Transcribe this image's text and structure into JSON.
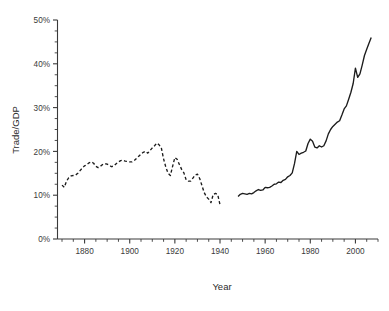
{
  "chart_data": {
    "type": "line",
    "title": "",
    "xlabel": "Year",
    "ylabel": "Trade/GDP",
    "xlim": [
      1868,
      2010
    ],
    "ylim": [
      0,
      50
    ],
    "grid": false,
    "legend": null,
    "y_unit": "%",
    "x_tick_labels": [
      "1880",
      "1900",
      "1920",
      "1940",
      "1960",
      "1980",
      "2000"
    ],
    "x_ticks": [
      1880,
      1900,
      1920,
      1940,
      1960,
      1980,
      2000
    ],
    "x_minor_step": 5,
    "y_tick_labels": [
      "0%",
      "10%",
      "20%",
      "30%",
      "40%",
      "50%"
    ],
    "y_ticks": [
      0,
      10,
      20,
      30,
      40,
      50
    ],
    "y_minor_step": 2.5,
    "series": [
      {
        "name": "Trade/GDP (pre-war)",
        "style": "dashed",
        "x": [
          1870,
          1871,
          1872,
          1873,
          1874,
          1875,
          1876,
          1877,
          1878,
          1879,
          1880,
          1881,
          1882,
          1883,
          1884,
          1885,
          1886,
          1887,
          1888,
          1889,
          1890,
          1891,
          1892,
          1893,
          1894,
          1895,
          1896,
          1897,
          1898,
          1899,
          1900,
          1901,
          1902,
          1903,
          1904,
          1905,
          1906,
          1907,
          1908,
          1909,
          1910,
          1911,
          1912,
          1913,
          1914,
          1915,
          1916,
          1917,
          1918,
          1919,
          1920,
          1921,
          1922,
          1923,
          1924,
          1925,
          1926,
          1927,
          1928,
          1929,
          1930,
          1931,
          1932,
          1933,
          1934,
          1935,
          1936,
          1937,
          1938,
          1939,
          1940
        ],
        "values": [
          12.3,
          11.8,
          13.2,
          14.0,
          14.4,
          14.5,
          14.6,
          15.0,
          15.6,
          16.2,
          16.7,
          17.0,
          17.4,
          17.6,
          17.3,
          16.6,
          16.3,
          16.6,
          17.0,
          17.2,
          17.1,
          16.8,
          16.5,
          16.7,
          17.2,
          17.6,
          17.9,
          18.0,
          17.8,
          17.7,
          17.6,
          17.6,
          17.9,
          18.4,
          18.9,
          19.4,
          19.8,
          20.0,
          19.6,
          20.2,
          20.8,
          21.3,
          21.9,
          21.5,
          20.8,
          18.3,
          16.4,
          15.0,
          14.5,
          16.6,
          18.6,
          18.2,
          17.0,
          15.9,
          15.1,
          13.5,
          13.2,
          13.2,
          13.9,
          14.6,
          14.8,
          13.8,
          12.2,
          10.6,
          9.6,
          9.1,
          8.3,
          10.2,
          10.4,
          10.1,
          7.8
        ]
      },
      {
        "name": "Trade/GDP (post-war)",
        "style": "solid",
        "x": [
          1948,
          1949,
          1950,
          1951,
          1952,
          1953,
          1954,
          1955,
          1956,
          1957,
          1958,
          1959,
          1960,
          1961,
          1962,
          1963,
          1964,
          1965,
          1966,
          1967,
          1968,
          1969,
          1970,
          1971,
          1972,
          1973,
          1974,
          1975,
          1976,
          1977,
          1978,
          1979,
          1980,
          1981,
          1982,
          1983,
          1984,
          1985,
          1986,
          1987,
          1988,
          1989,
          1990,
          1991,
          1992,
          1993,
          1994,
          1995,
          1996,
          1997,
          1998,
          1999,
          2000,
          2001,
          2002,
          2003,
          2004,
          2005,
          2006,
          2007
        ],
        "values": [
          9.7,
          10.2,
          10.4,
          10.3,
          10.2,
          10.4,
          10.3,
          10.6,
          11.0,
          11.3,
          11.1,
          11.2,
          11.8,
          11.7,
          11.8,
          12.1,
          12.5,
          12.6,
          13.0,
          12.9,
          13.4,
          13.6,
          14.2,
          14.5,
          15.1,
          17.2,
          20.0,
          19.3,
          19.6,
          19.8,
          20.1,
          21.8,
          22.8,
          22.3,
          21.0,
          20.8,
          21.3,
          21.0,
          21.3,
          22.4,
          24.0,
          25.0,
          25.7,
          26.2,
          26.7,
          27.0,
          28.3,
          29.7,
          30.4,
          31.9,
          33.5,
          35.5,
          39.0,
          36.9,
          37.7,
          39.7,
          41.9,
          43.3,
          44.7,
          46.0
        ]
      }
    ]
  },
  "axes": {
    "ylabel": "Trade/GDP",
    "xlabel": "Year"
  }
}
